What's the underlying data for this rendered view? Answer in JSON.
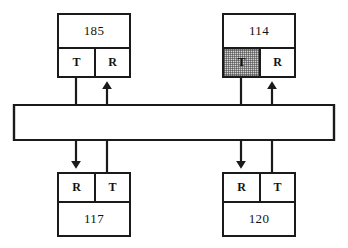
{
  "diagram": {
    "line_color": "#1a1a1a",
    "background_color": "#ffffff",
    "highlight_color": "#d3d3d3",
    "nodes": [
      {
        "id": "node-185",
        "value": "185",
        "value_position": "top",
        "ports": [
          {
            "label": "T",
            "side": "left",
            "highlighted": false
          },
          {
            "label": "R",
            "side": "right",
            "highlighted": false
          }
        ]
      },
      {
        "id": "node-114",
        "value": "114",
        "value_position": "top",
        "ports": [
          {
            "label": "T",
            "side": "left",
            "highlighted": true
          },
          {
            "label": "R",
            "side": "right",
            "highlighted": false
          }
        ]
      },
      {
        "id": "node-117",
        "value": "117",
        "value_position": "bottom",
        "ports": [
          {
            "label": "R",
            "side": "left",
            "highlighted": false
          },
          {
            "label": "T",
            "side": "right",
            "highlighted": false
          }
        ]
      },
      {
        "id": "node-120",
        "value": "120",
        "value_position": "bottom",
        "ports": [
          {
            "label": "R",
            "side": "left",
            "highlighted": false
          },
          {
            "label": "T",
            "side": "right",
            "highlighted": false
          }
        ]
      }
    ],
    "connections": [
      {
        "id": "edge-185T-to-117R",
        "from": "node-185.T",
        "to": "node-117.R",
        "arrow": "to"
      },
      {
        "id": "edge-117T-to-185R",
        "from": "node-117.T",
        "to": "node-185.R",
        "arrow": "to"
      },
      {
        "id": "edge-114T-to-120R",
        "from": "node-114.T",
        "to": "node-120.R",
        "arrow": "to"
      },
      {
        "id": "edge-120T-to-114R",
        "from": "node-120.T",
        "to": "node-114.R",
        "arrow": "to"
      }
    ]
  }
}
